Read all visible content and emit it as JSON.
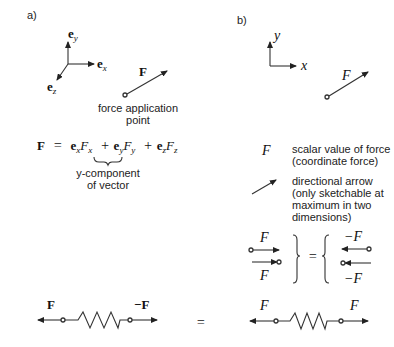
{
  "panels": {
    "a": {
      "label": "a)",
      "axes": {
        "y": "e",
        "y_sub": "y",
        "x": "e",
        "x_sub": "x",
        "z": "e",
        "z_sub": "z"
      },
      "force_vector": {
        "label": "F",
        "caption_line1": "force application",
        "caption_line2": "point"
      },
      "equation": {
        "lhs": "F",
        "eq": "=",
        "t1_e": "e",
        "t1_e_sub": "x",
        "t1_F": "F",
        "t1_F_sub": "x",
        "plus1": "+",
        "t2_e": "e",
        "t2_e_sub": "y",
        "t2_F": "F",
        "t2_F_sub": "y",
        "plus2": "+",
        "t3_e": "e",
        "t3_e_sub": "z",
        "t3_F": "F",
        "t3_F_sub": "z"
      },
      "brace_caption_line1": "y-component",
      "brace_caption_line2": "of vector",
      "spring": {
        "left_label": "F",
        "right_label": "−F"
      }
    },
    "b": {
      "label": "b)",
      "axes": {
        "y": "y",
        "x": "x"
      },
      "force_vector": {
        "label": "F"
      },
      "legend": [
        {
          "symbol": "F",
          "lines": [
            "scalar value of force",
            "(coordinate force)"
          ]
        },
        {
          "symbol": "directional-arrow",
          "lines": [
            "directional arrow",
            "(only sketchable at",
            " maximum in two",
            " dimensions)"
          ]
        }
      ],
      "equivalence": {
        "left_top": "F",
        "left_bottom": "F",
        "equals": "=",
        "right_top": "−F",
        "right_bottom": "−F"
      },
      "spring": {
        "left_label": "F",
        "right_label": "F"
      }
    },
    "middle_equals": "="
  },
  "colors": {
    "stroke": "#333333",
    "text": "#222222",
    "background": "#ffffff"
  }
}
